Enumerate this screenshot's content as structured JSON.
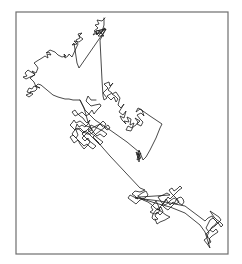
{
  "chart_data": {
    "type": "line",
    "title": "",
    "xlabel": "",
    "ylabel": "",
    "grid": false,
    "legend": null,
    "axes_visible": false,
    "frame": {
      "x": 16,
      "y": 12,
      "width": 212,
      "height": 242,
      "color": "#6e6e6e"
    },
    "line_color": "#1a1a1a",
    "series": [
      {
        "name": "trajectory",
        "points": [
          [
            105,
            18
          ],
          [
            102,
            21
          ],
          [
            97,
            20
          ],
          [
            99,
            24
          ],
          [
            95,
            25
          ],
          [
            98,
            28
          ],
          [
            94,
            31
          ],
          [
            97,
            33
          ],
          [
            93,
            35
          ],
          [
            96,
            31
          ],
          [
            101,
            30
          ],
          [
            105,
            28
          ],
          [
            101,
            33
          ],
          [
            96,
            34
          ],
          [
            106,
            29
          ],
          [
            100,
            40
          ],
          [
            101,
            60
          ],
          [
            102,
            80
          ],
          [
            103,
            96
          ],
          [
            104,
            100
          ],
          [
            107,
            98
          ],
          [
            103,
            93
          ],
          [
            108,
            88
          ],
          [
            104,
            84
          ],
          [
            109,
            82
          ],
          [
            110,
            86
          ],
          [
            113,
            83
          ],
          [
            108,
            90
          ],
          [
            112,
            93
          ],
          [
            107,
            96
          ],
          [
            111,
            100
          ],
          [
            114,
            97
          ],
          [
            116,
            102
          ],
          [
            118,
            99
          ],
          [
            115,
            96
          ],
          [
            112,
            94
          ],
          [
            116,
            92
          ],
          [
            120,
            98
          ],
          [
            118,
            105
          ],
          [
            121,
            108
          ],
          [
            124,
            104
          ],
          [
            119,
            112
          ],
          [
            123,
            115
          ],
          [
            126,
            111
          ],
          [
            124,
            118
          ],
          [
            120,
            116
          ],
          [
            122,
            120
          ],
          [
            126,
            124
          ],
          [
            124,
            121
          ],
          [
            129,
            122
          ],
          [
            127,
            117
          ],
          [
            131,
            119
          ],
          [
            130,
            125
          ],
          [
            134,
            123
          ],
          [
            132,
            128
          ],
          [
            128,
            126
          ],
          [
            126,
            130
          ],
          [
            131,
            131
          ],
          [
            133,
            127
          ],
          [
            136,
            125
          ],
          [
            138,
            122
          ],
          [
            135,
            118
          ],
          [
            140,
            121
          ],
          [
            137,
            124
          ],
          [
            141,
            126
          ],
          [
            143,
            122
          ],
          [
            140,
            119
          ],
          [
            137,
            115
          ],
          [
            141,
            113
          ],
          [
            144,
            116
          ],
          [
            142,
            110
          ],
          [
            138,
            108
          ],
          [
            136,
            112
          ],
          [
            140,
            109
          ],
          [
            150,
            116
          ],
          [
            162,
            124
          ],
          [
            160,
            128
          ],
          [
            156,
            138
          ],
          [
            150,
            150
          ],
          [
            146,
            157
          ],
          [
            143,
            160
          ],
          [
            139,
            150
          ],
          [
            137,
            155
          ],
          [
            141,
            153
          ],
          [
            138,
            158
          ],
          [
            136,
            152
          ],
          [
            140,
            155
          ],
          [
            139,
            162
          ],
          [
            138,
            154
          ],
          [
            141,
            158
          ],
          [
            137,
            160
          ],
          [
            139,
            152
          ],
          [
            140,
            151
          ],
          [
            139,
            152
          ],
          [
            127,
            142
          ],
          [
            110,
            130
          ],
          [
            95,
            120
          ],
          [
            85,
            110
          ],
          [
            80,
            100
          ],
          [
            73,
            100
          ],
          [
            69,
            99
          ],
          [
            65,
            99
          ],
          [
            58,
            97
          ],
          [
            53,
            95
          ],
          [
            47,
            90
          ],
          [
            41,
            85
          ],
          [
            38,
            84
          ],
          [
            36,
            86
          ],
          [
            40,
            88
          ],
          [
            34,
            86
          ],
          [
            32,
            89
          ],
          [
            29,
            88
          ],
          [
            27,
            92
          ],
          [
            31,
            93
          ],
          [
            26,
            95
          ],
          [
            29,
            97
          ],
          [
            33,
            94
          ],
          [
            30,
            92
          ],
          [
            35,
            91
          ],
          [
            37,
            89
          ],
          [
            34,
            82
          ],
          [
            30,
            78
          ],
          [
            33,
            76
          ],
          [
            35,
            74
          ],
          [
            31,
            72
          ],
          [
            28,
            70
          ],
          [
            25,
            73
          ],
          [
            27,
            76
          ],
          [
            23,
            77
          ],
          [
            26,
            79
          ],
          [
            30,
            77
          ],
          [
            35,
            75
          ],
          [
            32,
            71
          ],
          [
            36,
            73
          ],
          [
            38,
            68
          ],
          [
            36,
            65
          ],
          [
            34,
            63
          ],
          [
            37,
            61
          ],
          [
            42,
            58
          ],
          [
            45,
            56
          ],
          [
            48,
            58
          ],
          [
            47,
            54
          ],
          [
            51,
            55
          ],
          [
            49,
            52
          ],
          [
            46,
            53
          ],
          [
            50,
            50
          ],
          [
            55,
            52
          ],
          [
            58,
            55
          ],
          [
            62,
            57
          ],
          [
            66,
            56
          ],
          [
            64,
            54
          ],
          [
            65,
            58
          ],
          [
            68,
            56
          ],
          [
            69,
            54
          ],
          [
            72,
            57
          ],
          [
            78,
            44
          ],
          [
            76,
            40
          ],
          [
            80,
            38
          ],
          [
            78,
            34
          ],
          [
            82,
            33
          ],
          [
            79,
            36
          ],
          [
            83,
            39
          ],
          [
            79,
            42
          ],
          [
            74,
            41
          ],
          [
            77,
            44
          ],
          [
            72,
            45
          ],
          [
            74,
            43
          ],
          [
            77,
            63
          ],
          [
            79,
            68
          ],
          [
            106,
            29
          ],
          [
            96,
            31
          ],
          [
            97,
            35
          ],
          [
            99,
            31
          ],
          [
            104,
            36
          ],
          [
            98,
            36
          ],
          [
            102,
            32
          ],
          [
            104,
            25
          ],
          [
            104,
            18
          ]
        ],
        "extra_points_segment_2": [
          [
            96,
            100
          ],
          [
            91,
            100
          ],
          [
            88,
            96
          ],
          [
            86,
            101
          ],
          [
            91,
            106
          ],
          [
            95,
            105
          ],
          [
            100,
            104
          ],
          [
            101,
            106
          ],
          [
            97,
            110
          ],
          [
            94,
            114
          ],
          [
            92,
            110
          ],
          [
            89,
            114
          ],
          [
            86,
            116
          ],
          [
            82,
            112
          ],
          [
            79,
            114
          ],
          [
            75,
            116
          ],
          [
            72,
            112
          ],
          [
            75,
            110
          ],
          [
            77,
            113
          ],
          [
            80,
            116
          ],
          [
            83,
            118
          ],
          [
            85,
            121
          ],
          [
            87,
            123
          ],
          [
            90,
            120
          ],
          [
            88,
            124
          ],
          [
            85,
            127
          ],
          [
            82,
            125
          ],
          [
            79,
            127
          ],
          [
            77,
            124
          ],
          [
            75,
            130
          ],
          [
            73,
            128
          ],
          [
            70,
            125
          ],
          [
            72,
            123
          ],
          [
            74,
            120
          ],
          [
            76,
            123
          ],
          [
            80,
            121
          ],
          [
            84,
            124
          ],
          [
            86,
            126
          ],
          [
            90,
            127
          ],
          [
            92,
            130
          ],
          [
            88,
            132
          ],
          [
            85,
            135
          ],
          [
            82,
            138
          ],
          [
            85,
            141
          ],
          [
            88,
            138
          ],
          [
            90,
            142
          ],
          [
            87,
            146
          ],
          [
            84,
            149
          ],
          [
            80,
            144
          ],
          [
            78,
            140
          ],
          [
            74,
            143
          ],
          [
            72,
            140
          ],
          [
            70,
            137
          ],
          [
            73,
            135
          ],
          [
            76,
            138
          ],
          [
            78,
            135
          ],
          [
            76,
            130
          ],
          [
            80,
            128
          ],
          [
            84,
            132
          ],
          [
            87,
            134
          ],
          [
            91,
            134
          ],
          [
            94,
            131
          ],
          [
            97,
            127
          ],
          [
            100,
            124
          ],
          [
            103,
            127
          ]
        ]
      }
    ]
  }
}
